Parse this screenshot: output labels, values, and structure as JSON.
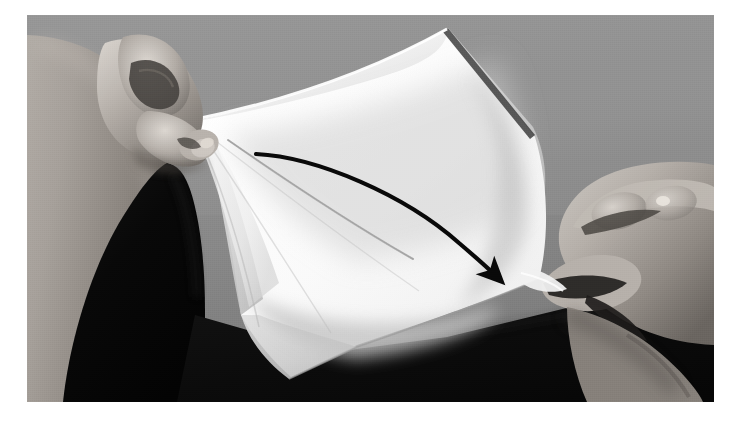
{
  "figure": {
    "kind": "instructional-photograph",
    "medium": "black-and-white photograph",
    "caption": ""
  },
  "colors": {
    "page_background": "#ffffff",
    "photo_background_gray": "#939393",
    "paper_white": "#fbfbfb",
    "paper_shadow": "#c9c9c9",
    "paper_deep_shadow": "#a8a8a8",
    "skin_light": "#cfcac4",
    "skin_mid": "#a39d98",
    "skin_dark": "#6d6863",
    "dark_cloth": "#0a0a0a",
    "arrow_black": "#090909",
    "crease_gray": "#b4b4b4"
  },
  "photo": {
    "frame": {
      "x": 27,
      "y": 15,
      "width": 687,
      "height": 387
    },
    "elements": [
      {
        "name": "background-wall",
        "label": "neutral gray studio backdrop"
      },
      {
        "name": "dark-cloth-left",
        "label": "dark shadowed clothing / table at lower left"
      },
      {
        "name": "dark-cloth-bottom",
        "label": "dark shadowed surface across the bottom"
      },
      {
        "name": "left-hand",
        "label": "left hand pinching the near corner of the paper"
      },
      {
        "name": "right-hand",
        "label": "right hand gripping the right corner of the paper"
      },
      {
        "name": "paper-sheet",
        "label": "square sheet of white paper being bent"
      },
      {
        "name": "paper-fold-crease",
        "label": "faint diagonal crease line across the sheet"
      },
      {
        "name": "motion-arrow",
        "label": "curved black arrow showing the folding direction"
      }
    ]
  },
  "annotation": {
    "arrow": {
      "name": "motion-arrow",
      "description": "curved arrow indicating fold direction",
      "start": {
        "x": 256,
        "y": 154
      },
      "end": {
        "x": 498,
        "y": 278
      },
      "direction": "left to right, curving downward",
      "color": "#090909",
      "stroke_width": 4
    },
    "crease_line": {
      "name": "paper-fold-crease",
      "start": {
        "x": 228,
        "y": 140
      },
      "end": {
        "x": 412,
        "y": 258
      },
      "color": "#b9b9b9"
    }
  }
}
